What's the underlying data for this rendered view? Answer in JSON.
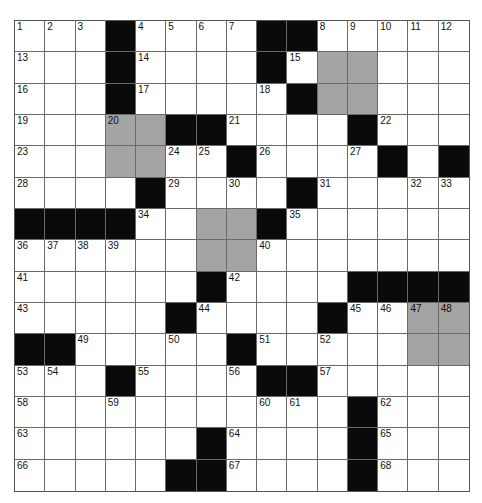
{
  "puzzle": {
    "rows": 15,
    "cols": 15,
    "colors": {
      "block": "#0a0a0a",
      "shaded": "#a4a4a4",
      "empty": "#ffffff",
      "gridline": "#6a6a6a"
    },
    "grid": [
      "...#....##.....",
      "...#....#.SS...",
      "...#.....#SS...",
      "...SS##....#...",
      "...SS..#....#.##",
      "....#....#.....",
      "####..SS#......",
      "......SS.......",
      "......#....####",
      ".....#....#..SS",
      "##.....#.....SS",
      "...#....##.....",
      "...........#...",
      "......#....#...",
      ".....##....#..."
    ],
    "numbers": [
      [
        1,
        2,
        3,
        0,
        4,
        5,
        6,
        7,
        0,
        0,
        8,
        9,
        10,
        11,
        12
      ],
      [
        13,
        0,
        0,
        0,
        14,
        0,
        0,
        0,
        0,
        15,
        0,
        0,
        0,
        0,
        0
      ],
      [
        16,
        0,
        0,
        0,
        17,
        0,
        0,
        0,
        18,
        0,
        0,
        0,
        0,
        0,
        0
      ],
      [
        19,
        0,
        0,
        20,
        0,
        0,
        0,
        21,
        0,
        0,
        0,
        0,
        22,
        0,
        0
      ],
      [
        23,
        0,
        0,
        0,
        0,
        24,
        25,
        0,
        26,
        0,
        0,
        27,
        0,
        0,
        0
      ],
      [
        28,
        0,
        0,
        0,
        0,
        29,
        0,
        30,
        0,
        0,
        31,
        0,
        0,
        32,
        33
      ],
      [
        0,
        0,
        0,
        0,
        34,
        0,
        0,
        0,
        0,
        35,
        0,
        0,
        0,
        0,
        0
      ],
      [
        36,
        37,
        38,
        39,
        0,
        0,
        0,
        0,
        40,
        0,
        0,
        0,
        0,
        0,
        0
      ],
      [
        41,
        0,
        0,
        0,
        0,
        0,
        0,
        42,
        0,
        0,
        0,
        0,
        0,
        0,
        0
      ],
      [
        43,
        0,
        0,
        0,
        0,
        0,
        44,
        0,
        0,
        0,
        0,
        45,
        46,
        47,
        48
      ],
      [
        0,
        0,
        49,
        0,
        0,
        50,
        0,
        0,
        51,
        0,
        52,
        0,
        0,
        0,
        0
      ],
      [
        53,
        54,
        0,
        0,
        55,
        0,
        0,
        56,
        0,
        0,
        57,
        0,
        0,
        0,
        0
      ],
      [
        58,
        0,
        0,
        59,
        0,
        0,
        0,
        0,
        60,
        61,
        0,
        0,
        62,
        0,
        0
      ],
      [
        63,
        0,
        0,
        0,
        0,
        0,
        0,
        64,
        0,
        0,
        0,
        0,
        65,
        0,
        0
      ],
      [
        66,
        0,
        0,
        0,
        0,
        0,
        0,
        67,
        0,
        0,
        0,
        0,
        68,
        0,
        0
      ]
    ]
  }
}
